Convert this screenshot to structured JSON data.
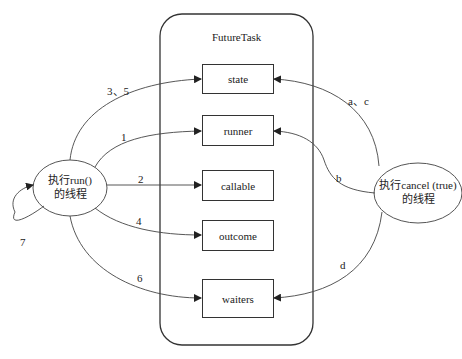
{
  "container": {
    "title": "FutureTask"
  },
  "fields": [
    {
      "id": "state",
      "label": "state"
    },
    {
      "id": "runner",
      "label": "runner"
    },
    {
      "id": "callable",
      "label": "callable"
    },
    {
      "id": "outcome",
      "label": "outcome"
    },
    {
      "id": "waiters",
      "label": "waiters"
    }
  ],
  "actors": {
    "run_thread": {
      "line1": "执行run()",
      "line2": "的线程"
    },
    "cancel_thread": {
      "line1": "执行cancel (true)",
      "line2": "的线程"
    }
  },
  "edges": {
    "run_to_state": "3、5",
    "run_to_runner": "1",
    "run_to_callable": "2",
    "run_to_outcome": "4",
    "run_to_waiters": "6",
    "run_self_loop": "7",
    "cancel_to_state": "a、c",
    "cancel_to_runner": "b",
    "cancel_to_waiters": "d"
  },
  "colors": {
    "stroke": "#333333",
    "background": "#ffffff",
    "text": "#222222"
  }
}
